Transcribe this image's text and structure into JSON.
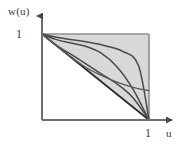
{
  "figure": {
    "axis_labels": {
      "y": "w(u)",
      "x": "u"
    },
    "tick_labels": {
      "y_one": "1",
      "x_one": "1"
    },
    "colors": {
      "axis": "#6e6e6e",
      "region_fill": "#d8d8d8",
      "region_border": "#9a9a9a",
      "curve": "#4a4a4a",
      "diagonal": "#2b2b2b",
      "text": "#3a3a3a",
      "background": "#ffffff"
    }
  },
  "chart_data": {
    "type": "line",
    "title": "",
    "subtitle": "",
    "xlabel": "u",
    "ylabel": "w(u)",
    "xlim": [
      0,
      1.25
    ],
    "ylim": [
      0,
      1.25
    ],
    "xticks": [
      1
    ],
    "xticklabels": [
      "1"
    ],
    "yticks": [
      1
    ],
    "yticklabels": [
      "1"
    ],
    "grid": false,
    "legend": null,
    "legend_position": "none",
    "annotations": [],
    "shaded_regions": [
      {
        "name": "feasible-region",
        "description": "Upper-right triangle bounded by the diagonal from (0,1) to (1,0), the top edge w=1 and the right edge u=1",
        "fill": "#d8d8d8",
        "vertices": [
          [
            0,
            1
          ],
          [
            1,
            1
          ],
          [
            1,
            0
          ]
        ]
      }
    ],
    "series": [
      {
        "name": "diagonal",
        "style": "straight-line",
        "x": [
          0.0,
          0.25,
          0.5,
          0.75,
          1.0
        ],
        "values": [
          1.0,
          0.75,
          0.5,
          0.25,
          0.0
        ]
      },
      {
        "name": "curve-1",
        "style": "concave",
        "x": [
          0.0,
          0.12,
          0.25,
          0.4,
          0.55,
          0.7,
          0.85,
          1.0
        ],
        "values": [
          1.0,
          0.88,
          0.78,
          0.66,
          0.54,
          0.42,
          0.26,
          0.0
        ]
      },
      {
        "name": "curve-2",
        "style": "sigmoid",
        "x": [
          0.0,
          0.12,
          0.25,
          0.4,
          0.55,
          0.7,
          0.85,
          1.0
        ],
        "values": [
          1.0,
          0.94,
          0.9,
          0.86,
          0.78,
          0.62,
          0.36,
          0.0
        ]
      },
      {
        "name": "curve-3",
        "style": "sigmoid-flat",
        "x": [
          0.0,
          0.15,
          0.3,
          0.45,
          0.6,
          0.75,
          0.9,
          1.0
        ],
        "values": [
          1.0,
          0.96,
          0.93,
          0.9,
          0.86,
          0.8,
          0.64,
          0.0
        ]
      },
      {
        "name": "curve-4",
        "style": "shallow-tail",
        "x": [
          0.0,
          0.2,
          0.4,
          0.55,
          0.7,
          0.85,
          1.0
        ],
        "values": [
          1.0,
          0.8,
          0.62,
          0.52,
          0.44,
          0.38,
          0.34
        ]
      }
    ]
  }
}
